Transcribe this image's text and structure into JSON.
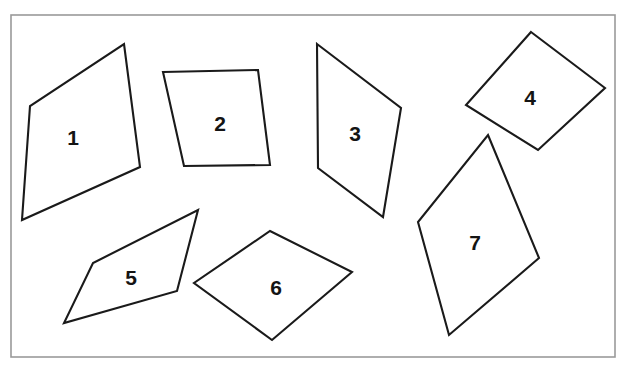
{
  "figure": {
    "background_color": "#ffffff",
    "frame": {
      "x": 11,
      "y": 15,
      "width": 604,
      "height": 342,
      "stroke_color": "#9a9a9a",
      "stroke_width": 1.6
    },
    "stroke_color": "#1a1a1a",
    "fill_color": "#ffffff",
    "label_color": "#141414",
    "shape_count": 7,
    "shapes": [
      {
        "label": "1",
        "sides": 4,
        "points": "124,44 140,167 22,220 30,106",
        "label_x": 73,
        "label_y": 137
      },
      {
        "label": "2",
        "sides": 4,
        "points": "163,72 258,70 270,165 184,166",
        "label_x": 220,
        "label_y": 123
      },
      {
        "label": "3",
        "sides": 4,
        "points": "317,44 401,108 383,217 318,168",
        "label_x": 355,
        "label_y": 133
      },
      {
        "label": "4",
        "sides": 4,
        "points": "531,32 605,88 538,150 466,105",
        "label_x": 530,
        "label_y": 97
      },
      {
        "label": "5",
        "sides": 4,
        "points": "198,210 177,291 64,323 93,263",
        "label_x": 131,
        "label_y": 277
      },
      {
        "label": "6",
        "sides": 4,
        "points": "270,231 352,272 272,340 194,283",
        "label_x": 276,
        "label_y": 287
      },
      {
        "label": "7",
        "sides": 4,
        "points": "488,135 539,258 449,335 418,222",
        "label_x": 475,
        "label_y": 242
      }
    ]
  }
}
